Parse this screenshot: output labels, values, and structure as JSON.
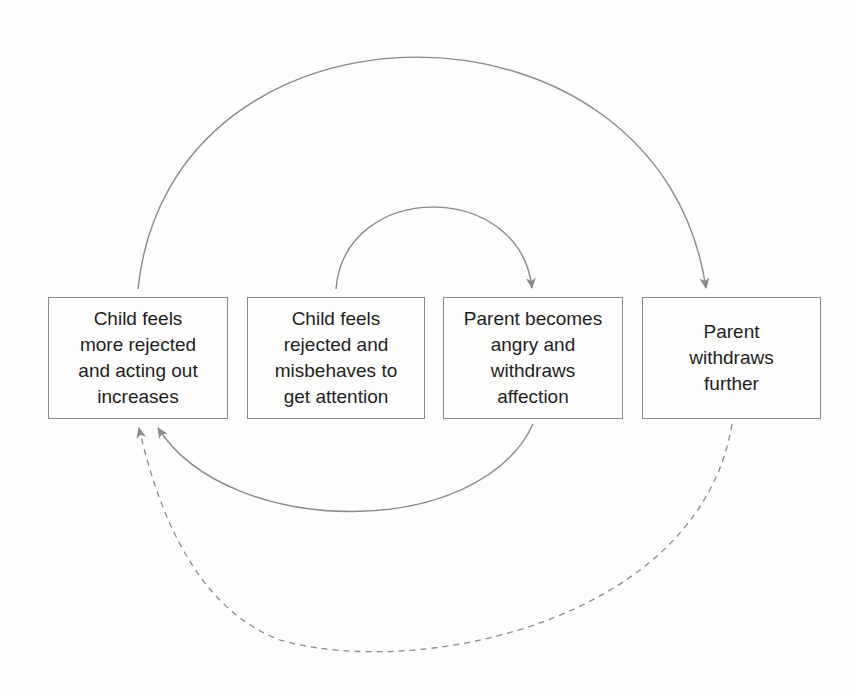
{
  "diagram": {
    "type": "cycle-flow",
    "boxes": [
      {
        "id": "b1",
        "label": "Child feels\nmore rejected\nand acting out\nincreases"
      },
      {
        "id": "b2",
        "label": "Child feels\nrejected and\nmisbehaves to\nget attention"
      },
      {
        "id": "b3",
        "label": "Parent becomes\nangry and\nwithdraws\naffection"
      },
      {
        "id": "b4",
        "label": "Parent\nwithdraws\nfurther"
      }
    ],
    "edges": [
      {
        "from": "b2",
        "to": "b3",
        "style": "solid",
        "route": "inner arc above"
      },
      {
        "from": "b3",
        "to": "b1",
        "style": "solid",
        "route": "arc below"
      },
      {
        "from": "b1",
        "to": "b4",
        "style": "solid",
        "route": "outer arc above"
      },
      {
        "from": "b4",
        "to": "b1",
        "style": "dashed",
        "route": "outer arc below"
      }
    ],
    "colors": {
      "line": "#8a8a8a",
      "text": "#1e1e1e",
      "background": "#fdfdfc"
    }
  }
}
